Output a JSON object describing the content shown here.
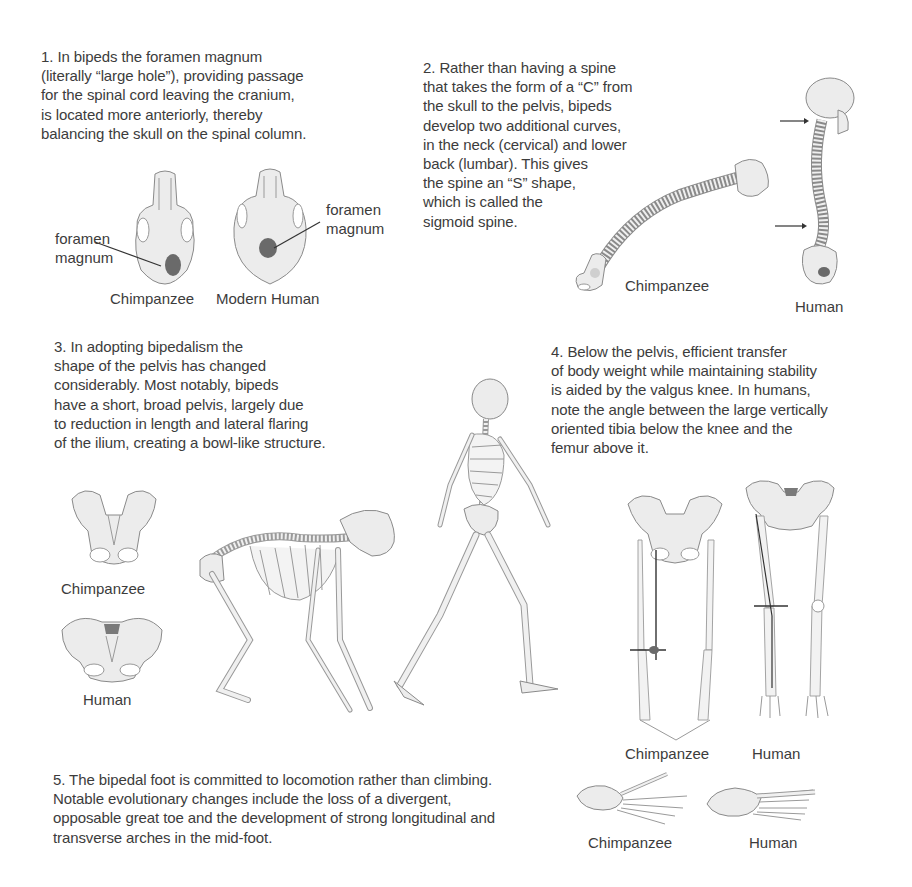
{
  "sections": [
    {
      "number": "1.",
      "text": "1.  In bipeds the foramen magnum\n(literally “large hole”), providing passage\nfor the spinal cord leaving the cranium,\nis located more anteriorly, thereby\nbalancing the skull on the spinal column.",
      "labels": {
        "chimp_foramen": "foramen\nmagnum",
        "human_foramen": "foramen\nmagnum",
        "chimp_caption": "Chimpanzee",
        "human_caption": "Modern Human"
      }
    },
    {
      "number": "2.",
      "text": "2.  Rather than having a spine\nthat takes the form of a “C” from\nthe skull to the pelvis, bipeds\ndevelop two additional curves,\nin the neck (cervical) and lower\nback (lumbar). This gives\nthe spine an “S” shape,\nwhich is called the\nsigmoid spine.",
      "labels": {
        "chimp_caption": "Chimpanzee",
        "human_caption": "Human"
      }
    },
    {
      "number": "3.",
      "text": "3.  In adopting bipedalism the\nshape of the pelvis has changed\nconsiderably. Most notably, bipeds\nhave a short, broad pelvis, largely due\nto reduction in length and lateral flaring\nof the ilium, creating a bowl-like structure.",
      "labels": {
        "chimp_caption": "Chimpanzee",
        "human_caption": "Human"
      }
    },
    {
      "number": "4.",
      "text": "4.  Below the pelvis, efficient transfer\nof body weight while maintaining stability\nis aided by the valgus knee. In humans,\nnote the angle between the large vertically\noriented tibia below the knee and the\nfemur above it.",
      "labels": {
        "chimp_caption": "Chimpanzee",
        "human_caption": "Human"
      }
    },
    {
      "number": "5.",
      "text": "5.  The bipedal foot is committed to locomotion rather than climbing.\nNotable evolutionary changes include the loss of a divergent,\nopposable great toe and the development of strong longitudinal and\ntransverse arches in the mid-foot.",
      "labels": {
        "chimp_caption": "Chimpanzee",
        "human_caption": "Human"
      }
    }
  ],
  "icons": {
    "chimp_skull": "chimpanzee-skull-underside",
    "human_skull": "human-skull-underside",
    "chimp_spine": "chimpanzee-spine",
    "human_spine": "human-spine",
    "chimp_pelvis": "chimpanzee-pelvis",
    "human_pelvis": "human-pelvis",
    "chimp_skeleton": "chimpanzee-skeleton",
    "human_skeleton": "human-skeleton",
    "chimp_legs": "chimpanzee-legs",
    "human_legs": "human-legs",
    "chimp_foot": "chimpanzee-foot",
    "human_foot": "human-foot"
  },
  "colors": {
    "text": "#3c3c3c",
    "bone_fill": "#ececec",
    "bone_stroke": "#8a8a8a",
    "foramen": "#6a6a6a",
    "background": "#ffffff"
  }
}
